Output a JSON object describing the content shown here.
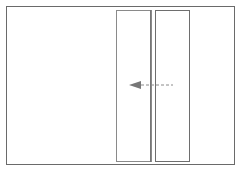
{
  "diagram": {
    "colors": {
      "frame": "#6a6a6a",
      "panel": "#8a8a8a",
      "arrow": "#7a7a7a"
    },
    "arrow": {
      "direction": "left",
      "style": "dashed"
    }
  }
}
